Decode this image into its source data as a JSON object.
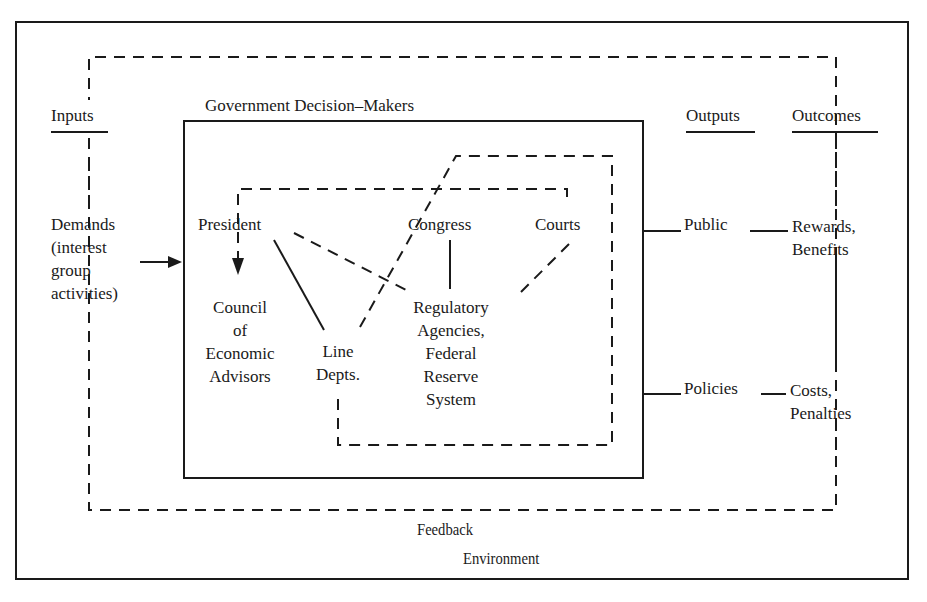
{
  "diagram": {
    "colors": {
      "ink": "#1a1a1a",
      "background": "#ffffff"
    },
    "outer_frame_label": "Environment",
    "feedback_label": "Feedback",
    "government_box_label": "Government Decision–Makers",
    "columns": {
      "inputs": "Inputs",
      "outputs": "Outputs",
      "outcomes": "Outcomes"
    },
    "inputs": {
      "demands": "Demands\n(interest\ngroup\nactivities)"
    },
    "actors": {
      "president": "President",
      "congress": "Congress",
      "courts": "Courts",
      "council": "Council\nof\nEconomic\nAdvisors",
      "line_depts": "Line\nDepts.",
      "regulatory": "Regulatory\nAgencies,\nFederal\nReserve\nSystem"
    },
    "outputs": {
      "public": "Public",
      "policies": "Policies"
    },
    "outcomes": {
      "rewards": "Rewards,\nBenefits",
      "costs": "Costs,\nPenalties"
    }
  }
}
